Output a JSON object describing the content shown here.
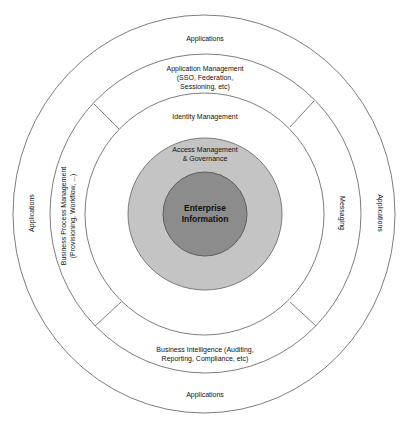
{
  "diagram": {
    "colors": {
      "background": "#ffffff",
      "ring_stroke": "#6e6e6e",
      "governance_fill": "#c4c4c4",
      "core_fill": "#8c8c8c"
    },
    "rings": [
      {
        "name": "outer-applications-ring",
        "labels": {
          "top": "Applications",
          "bottom": "Applications",
          "left": "Applications",
          "right": "Applications"
        }
      },
      {
        "name": "services-ring",
        "labels": {
          "top": [
            "Application Management",
            "(SSO, Federation,",
            "Sessioning, etc)"
          ],
          "bottom": [
            "Business Intelligence (Auditing,",
            "Reporting, Compliance, etc)"
          ],
          "left": [
            "Business Process Management",
            "(Provisioning, Workflow, ...)"
          ],
          "right": "Messaging"
        }
      },
      {
        "name": "identity-ring",
        "label": "Identity Management"
      },
      {
        "name": "governance-ring",
        "label": [
          "Access Management",
          "& Governance"
        ]
      },
      {
        "name": "core-circle",
        "label": [
          "Enterprise",
          "Information"
        ]
      }
    ]
  }
}
